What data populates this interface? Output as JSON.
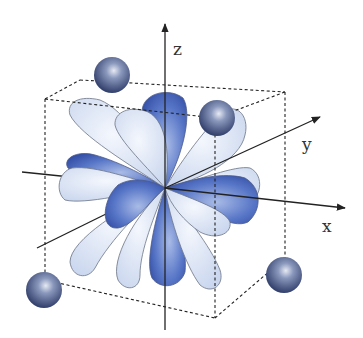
{
  "diagram": {
    "axes": {
      "x": {
        "label": "x"
      },
      "y": {
        "label": "y"
      },
      "z": {
        "label": "z"
      }
    },
    "ligands": {
      "count": 4,
      "labels": [
        "ligand-top-left-back",
        "ligand-top-right-front",
        "ligand-bottom-left-front",
        "ligand-bottom-right-back"
      ]
    },
    "colors": {
      "light_lobe": "#dde6f5",
      "dark_lobe": "#3e5fb8",
      "ligand": "#5a6b9a",
      "lines": "#222222"
    }
  }
}
